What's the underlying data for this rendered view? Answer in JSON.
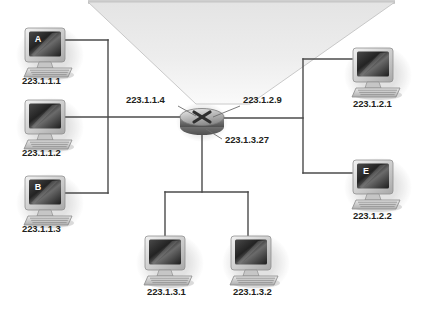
{
  "diagram": {
    "canvas": {
      "width": 421,
      "height": 311,
      "background": "#ffffff"
    },
    "colors": {
      "line": "#4b4b4b",
      "leader": "#6e6e6e",
      "label_text": "#231f20",
      "badge_text": "#ffffff",
      "cloud_fill_top": "#e9e9e9",
      "cloud_fill_bottom": "#f7f7f7",
      "cloud_stroke": "#b4b4b4",
      "screen_dark": "#2b2b2b",
      "bezel_light": "#d8d8d8",
      "shadow": "#d9d9d9"
    },
    "cloud": {
      "name": "internet-cloud",
      "shape": "inverted-trapezoid",
      "label": ""
    },
    "router": {
      "name": "router",
      "glyph": "x-symbol",
      "x": 202,
      "y": 120,
      "interfaces": [
        {
          "id": "if-left",
          "label": "223.1.1.4",
          "label_x": 126,
          "label_y": 103,
          "anchor": "start",
          "leader": [
            [
              178,
              106
            ],
            [
              196,
              116
            ]
          ]
        },
        {
          "id": "if-right",
          "label": "223.1.2.9",
          "label_x": 243,
          "label_y": 103,
          "anchor": "start",
          "leader": [
            [
              240,
              106
            ],
            [
              213,
              117
            ]
          ]
        },
        {
          "id": "if-bottom",
          "label": "223.1.3.27",
          "label_x": 225,
          "label_y": 143,
          "anchor": "start",
          "leader": [
            [
              222,
              139
            ],
            [
              206,
              129
            ]
          ]
        }
      ]
    },
    "subnets": [
      {
        "id": "subnet-223-1-1",
        "name": "left-subnet",
        "hosts": [
          {
            "id": "host-a",
            "ip": "223.1.1.1",
            "badge": "A",
            "x": 22,
            "y": 28,
            "label_x": 22,
            "label_y": 84
          },
          {
            "id": "host-a2",
            "ip": "223.1.1.2",
            "badge": "",
            "x": 22,
            "y": 100,
            "label_x": 22,
            "label_y": 156
          },
          {
            "id": "host-b",
            "ip": "223.1.1.3",
            "badge": "B",
            "x": 22,
            "y": 176,
            "label_x": 22,
            "label_y": 232
          }
        ]
      },
      {
        "id": "subnet-223-1-2",
        "name": "right-subnet",
        "hosts": [
          {
            "id": "host-c",
            "ip": "223.1.2.1",
            "badge": "",
            "x": 350,
            "y": 48,
            "label_x": 353,
            "label_y": 107
          },
          {
            "id": "host-e",
            "ip": "223.1.2.2",
            "badge": "E",
            "x": 350,
            "y": 160,
            "label_x": 353,
            "label_y": 219
          }
        ]
      },
      {
        "id": "subnet-223-1-3",
        "name": "bottom-subnet",
        "hosts": [
          {
            "id": "host-d",
            "ip": "223.1.3.1",
            "badge": "",
            "x": 142,
            "y": 236,
            "label_x": 147,
            "label_y": 295
          },
          {
            "id": "host-f",
            "ip": "223.1.3.2",
            "badge": "",
            "x": 228,
            "y": 236,
            "label_x": 233,
            "label_y": 295
          }
        ]
      }
    ]
  }
}
